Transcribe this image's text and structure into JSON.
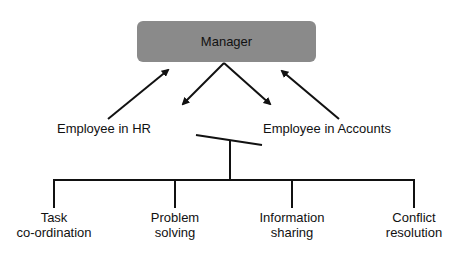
{
  "diagram": {
    "top_node": {
      "label": "Manager",
      "fill": "#8a8a8a"
    },
    "middle_nodes": [
      {
        "label": "Employee in HR"
      },
      {
        "label": "Employee in Accounts"
      }
    ],
    "bottom_nodes": [
      {
        "line1": "Task",
        "line2": "co-ordination"
      },
      {
        "line1": "Problem",
        "line2": "solving"
      },
      {
        "line1": "Information",
        "line2": "sharing"
      },
      {
        "line1": "Conflict",
        "line2": "resolution"
      }
    ],
    "line_color": "#111111"
  }
}
